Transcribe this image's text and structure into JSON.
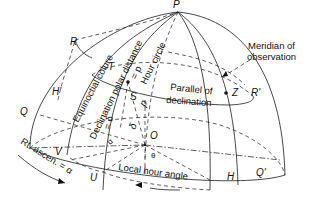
{
  "diagram": {
    "points": {
      "P": "P",
      "R": "R",
      "R_prime": "R'",
      "Q": "Q",
      "Q_prime": "Q'",
      "H": "H",
      "H_prime": "H'",
      "V": "V",
      "U": "U",
      "O": "O",
      "Z": "Z",
      "S": "S",
      "T": "T"
    },
    "labels": {
      "equinoctial_colure": "Equinoctial colure",
      "polar_distance": "Declination polar distance",
      "polar_distance_eq": "= p",
      "hour_circle": "Hour circle",
      "declination": "Declination",
      "declination_eq": "= δ",
      "meridian_line1": "Meridian of",
      "meridian_line2": "observation",
      "parallel_line1": "Parallel of",
      "parallel_line2": "declination",
      "local_hour_angle": "Local hour angle",
      "rt_ascen": "Rt. ascen. = α",
      "delta": "δ",
      "p": "p",
      "alpha": "α",
      "theta": "θ"
    }
  }
}
